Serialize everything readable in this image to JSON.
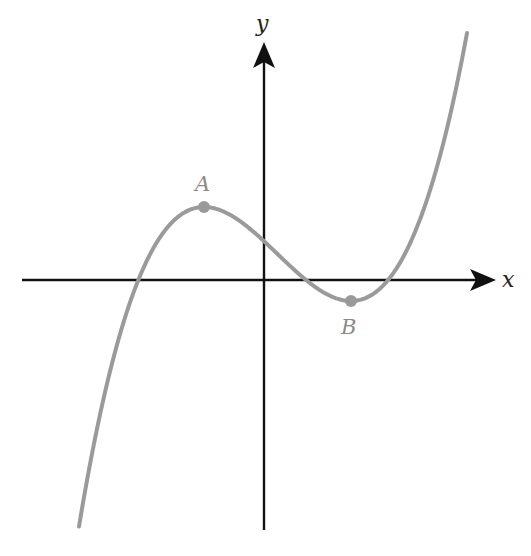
{
  "figure": {
    "axes": {
      "x_label": "x",
      "y_label": "y"
    },
    "points": [
      {
        "name": "A",
        "role": "local maximum",
        "px": 204,
        "py": 207
      },
      {
        "name": "B",
        "role": "local minimum",
        "px": 351,
        "py": 301
      }
    ],
    "colors": {
      "axes": "#111111",
      "curve": "#9a9a9a",
      "point_labels": "#8a8a8a",
      "background": "#ffffff"
    }
  },
  "chart_data": {
    "type": "line",
    "title": "",
    "xlabel": "x",
    "ylabel": "y",
    "grid": false,
    "legend": null,
    "curve": "cubic with positive leading coefficient",
    "features": {
      "local_max": {
        "label": "A",
        "x_sign": "negative",
        "y_sign": "positive"
      },
      "local_min": {
        "label": "B",
        "x_sign": "positive",
        "y_sign": "negative"
      },
      "x_intercepts": 3,
      "y_intercept_sign": "positive"
    },
    "ticks": []
  }
}
